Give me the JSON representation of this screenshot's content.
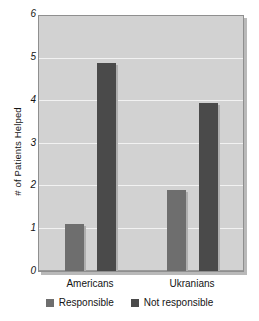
{
  "chart_data": {
    "type": "bar",
    "title": "",
    "xlabel": "",
    "ylabel": "# of Patients Helped",
    "categories": [
      "Americans",
      "Ukranians"
    ],
    "series": [
      {
        "name": "Responsible",
        "color": "#6e6e6e",
        "values": [
          1.1,
          1.9
        ]
      },
      {
        "name": "Not responsible",
        "color": "#4a4a4a",
        "values": [
          4.9,
          3.95
        ]
      }
    ],
    "ylim": [
      0,
      6
    ],
    "yticks": [
      "0",
      "1",
      "2",
      "3",
      "4",
      "5",
      "6"
    ],
    "grid": true,
    "legend_position": "bottom",
    "plot_background": "#d2d2d2",
    "gridline_color": "#f2f2f2"
  },
  "axis": {
    "y_title": "# of Patients Helped",
    "y_tick_0": "0",
    "y_tick_1": "1",
    "y_tick_2": "2",
    "y_tick_3": "3",
    "y_tick_4": "4",
    "y_tick_5": "5",
    "y_tick_6": "6",
    "x_cat_0": "Americans",
    "x_cat_1": "Ukranians"
  },
  "legend": {
    "item_0_label": "Responsible",
    "item_1_label": "Not responsible"
  }
}
